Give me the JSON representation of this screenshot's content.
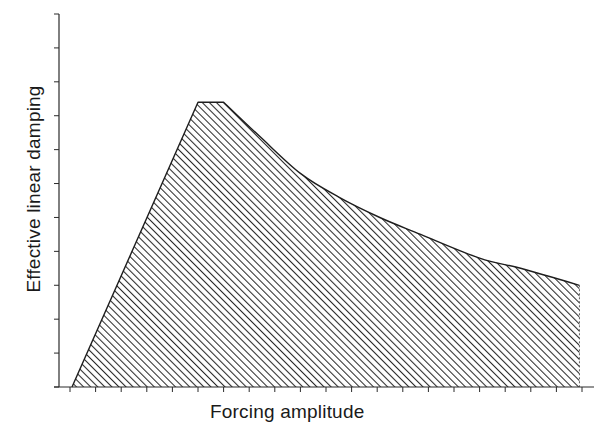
{
  "chart_data": {
    "type": "area",
    "title": "",
    "xlabel": "Forcing amplitude",
    "ylabel": "Effective linear damping",
    "x_ticks_count": 21,
    "y_ticks_count": 12,
    "xlim": [
      0,
      20
    ],
    "ylim": [
      0,
      11
    ],
    "tick_labels_shown": false,
    "grid": false,
    "legend": null,
    "fill_pattern": "diagonal-hatch",
    "series": [
      {
        "name": "Effective linear damping",
        "points": [
          {
            "x": 0.08,
            "y": 0.0
          },
          {
            "x": 5.0,
            "y": 8.4
          },
          {
            "x": 6.0,
            "y": 8.4
          },
          {
            "x": 7.4,
            "y": 7.4
          },
          {
            "x": 9.0,
            "y": 6.3
          },
          {
            "x": 10.5,
            "y": 5.6
          },
          {
            "x": 12.1,
            "y": 5.0
          },
          {
            "x": 13.7,
            "y": 4.5
          },
          {
            "x": 16.0,
            "y": 3.8
          },
          {
            "x": 17.6,
            "y": 3.5
          },
          {
            "x": 19.9,
            "y": 3.0
          }
        ]
      }
    ]
  },
  "labels": {
    "x_axis": "Forcing amplitude",
    "y_axis": "Effective linear damping"
  },
  "colors": {
    "ink": "#1e1e1e",
    "background": "#ffffff"
  }
}
